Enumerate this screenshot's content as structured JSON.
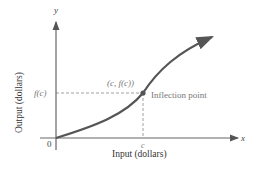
{
  "diagram": {
    "axis_x_label": "x",
    "axis_y_label": "y",
    "xlabel": "Input (dollars)",
    "ylabel": "Output (dollars)",
    "origin_label": "0",
    "x_tick_label": "c",
    "y_tick_label": "f(c)",
    "point_label": "(c, f(c))",
    "annotation": "Inflection point",
    "colors": {
      "curve": "#555555",
      "axes": "#555555",
      "dashed": "#888888",
      "text": "#333333",
      "muted_text": "#777777"
    }
  }
}
